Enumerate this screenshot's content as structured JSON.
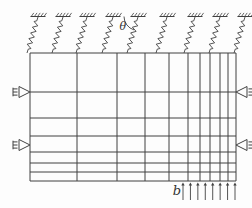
{
  "figure": {
    "background": "#fdfdfd",
    "line_color": "#414141",
    "labels": {
      "angle": "θ",
      "load": "b"
    },
    "plate": {
      "left": 30,
      "top": 53,
      "right": 236,
      "bottom": 181
    },
    "mesh": {
      "vertical_lines_x": [
        30,
        77,
        117,
        145,
        169,
        188,
        200,
        210,
        220,
        228,
        236
      ],
      "horizontal_lines_y": [
        53,
        92,
        118,
        136,
        152,
        163,
        172,
        181
      ]
    },
    "springs": {
      "count": 9,
      "anchor_y": 16.5,
      "attach_y": 53,
      "anchors_x": [
        38,
        63,
        87,
        113,
        138,
        167,
        195,
        220,
        245
      ],
      "attach_offset_x": -11,
      "coils": 5,
      "amplitude": 2.4,
      "theta_index": 4,
      "arc_radius": 14
    },
    "supports": [
      {
        "side": "left",
        "x": 30,
        "y": 92
      },
      {
        "side": "left",
        "x": 30,
        "y": 145
      },
      {
        "side": "right",
        "x": 236,
        "y": 92
      },
      {
        "side": "right",
        "x": 236,
        "y": 145
      }
    ],
    "load_arrows": {
      "count": 8,
      "x_start": 183,
      "x_end": 235,
      "y_tail": 200,
      "y_head": 182.5
    }
  }
}
